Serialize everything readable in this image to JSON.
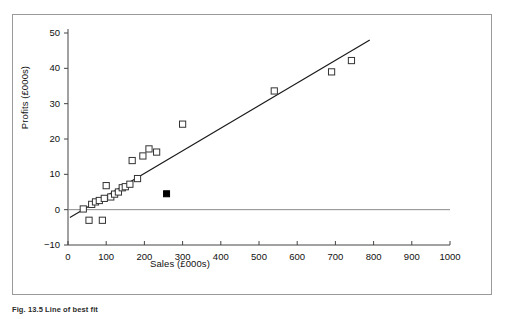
{
  "figure": {
    "caption": "Fig. 13.5 Line of best fit"
  },
  "chart_data": {
    "type": "scatter",
    "title": "",
    "xlabel": "Sales (£000s)",
    "ylabel": "Profits (£000s)",
    "xlim": [
      0,
      1000
    ],
    "ylim": [
      -10,
      50
    ],
    "xticks": [
      0,
      100,
      200,
      300,
      400,
      500,
      600,
      700,
      800,
      900,
      1000
    ],
    "yticks": [
      -10,
      0,
      10,
      20,
      30,
      40,
      50
    ],
    "xtick_labels": [
      "0",
      "100",
      "200",
      "300",
      "400",
      "500",
      "600",
      "700",
      "800",
      "900",
      "1000"
    ],
    "ytick_labels": [
      "-10",
      "0",
      "10",
      "20",
      "30",
      "40",
      "50"
    ],
    "grid": false,
    "legend": null,
    "series": [
      {
        "name": "Observations",
        "marker": "open-square",
        "marker_color": "#ffffff",
        "marker_edge_color": "#333333",
        "points": [
          {
            "x": 40,
            "y": 0.2
          },
          {
            "x": 55,
            "y": -3.0
          },
          {
            "x": 62,
            "y": 1.5
          },
          {
            "x": 72,
            "y": 2.2
          },
          {
            "x": 82,
            "y": 2.6
          },
          {
            "x": 90,
            "y": -3.0
          },
          {
            "x": 95,
            "y": 3.2
          },
          {
            "x": 100,
            "y": 6.8
          },
          {
            "x": 112,
            "y": 3.6
          },
          {
            "x": 122,
            "y": 4.4
          },
          {
            "x": 132,
            "y": 5.0
          },
          {
            "x": 142,
            "y": 6.2
          },
          {
            "x": 150,
            "y": 6.5
          },
          {
            "x": 162,
            "y": 7.2
          },
          {
            "x": 168,
            "y": 13.9
          },
          {
            "x": 182,
            "y": 8.8
          },
          {
            "x": 196,
            "y": 15.2
          },
          {
            "x": 212,
            "y": 17.2
          },
          {
            "x": 232,
            "y": 16.3
          },
          {
            "x": 300,
            "y": 24.2
          },
          {
            "x": 540,
            "y": 33.6
          },
          {
            "x": 690,
            "y": 39.0
          },
          {
            "x": 742,
            "y": 42.2
          }
        ]
      },
      {
        "name": "Outlier",
        "marker": "filled-square",
        "marker_color": "#000000",
        "marker_edge_color": "#000000",
        "points": [
          {
            "x": 258,
            "y": 4.5
          }
        ]
      }
    ],
    "lines": [
      {
        "name": "Line of best fit",
        "style": "solid",
        "color": "#1a1a1a",
        "width": 1.2,
        "from": {
          "x": 5,
          "y": -2.2
        },
        "to": {
          "x": 790,
          "y": 48.0
        }
      },
      {
        "name": "Zero reference line",
        "style": "solid",
        "color": "#8a8a8a",
        "width": 1,
        "from": {
          "x": 0,
          "y": 0
        },
        "to": {
          "x": 1000,
          "y": 0
        }
      }
    ]
  }
}
